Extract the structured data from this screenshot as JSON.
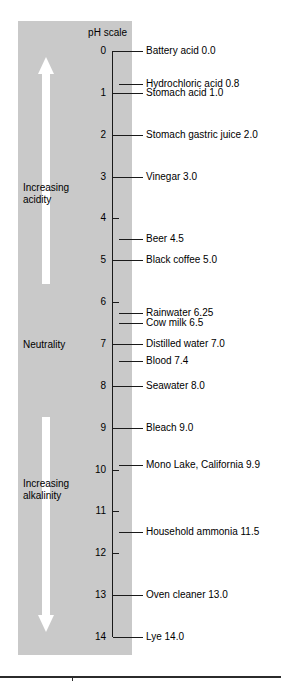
{
  "figure": {
    "title": "pH scale",
    "axis": {
      "min": 0,
      "max": 14,
      "ticks": [
        "0",
        "1",
        "2",
        "3",
        "4",
        "5",
        "6",
        "7",
        "8",
        "9",
        "10",
        "11",
        "12",
        "13",
        "14"
      ]
    },
    "annotations": {
      "increasing_acidity": "Increasing\nacidity",
      "increasing_acidity_line1": "Increasing",
      "increasing_acidity_line2": "acidity",
      "neutrality": "Neutrality",
      "increasing_alkalinity_line1": "Increasing",
      "increasing_alkalinity_line2": "alkalinity"
    },
    "colors": {
      "panel": "#c9c9c9",
      "arrow": "#ffffff",
      "axis": "#1a1a1a",
      "text": "#000000",
      "background": "#ffffff",
      "footer_rule": "#2b2b2b"
    }
  },
  "chart_data": {
    "type": "scatter",
    "title": "pH scale",
    "xlabel": "",
    "ylabel": "pH scale",
    "ylim": [
      0,
      14
    ],
    "y_inverted": true,
    "grid": false,
    "legend": "none",
    "tick_labels": [
      "0",
      "1",
      "2",
      "3",
      "4",
      "5",
      "6",
      "7",
      "8",
      "9",
      "10",
      "11",
      "12",
      "13",
      "14"
    ],
    "categories": [
      "Battery acid",
      "Hydrochloric acid",
      "Stomach acid",
      "Stomach gastric juice",
      "Vinegar",
      "Beer",
      "Black coffee",
      "Rainwater",
      "Cow milk",
      "Distilled water",
      "Blood",
      "Seawater",
      "Bleach",
      "Mono Lake, California",
      "Household ammonia",
      "Oven cleaner",
      "Lye"
    ],
    "values": [
      0.0,
      0.8,
      1.0,
      2.0,
      3.0,
      4.5,
      5.0,
      6.25,
      6.5,
      7.0,
      7.4,
      8.0,
      9.0,
      9.9,
      11.5,
      13.0,
      14.0
    ],
    "points": [
      {
        "label": "Battery acid 0.0",
        "name": "Battery acid",
        "ph": 0.0
      },
      {
        "label": "Hydrochloric acid 0.8",
        "name": "Hydrochloric acid",
        "ph": 0.8
      },
      {
        "label": "Stomach acid 1.0",
        "name": "Stomach acid",
        "ph": 1.0
      },
      {
        "label": "Stomach gastric juice 2.0",
        "name": "Stomach gastric juice",
        "ph": 2.0
      },
      {
        "label": "Vinegar 3.0",
        "name": "Vinegar",
        "ph": 3.0
      },
      {
        "label": "Beer 4.5",
        "name": "Beer",
        "ph": 4.5
      },
      {
        "label": "Black coffee 5.0",
        "name": "Black coffee",
        "ph": 5.0
      },
      {
        "label": "Rainwater 6.25",
        "name": "Rainwater",
        "ph": 6.25
      },
      {
        "label": "Cow milk 6.5",
        "name": "Cow milk",
        "ph": 6.5
      },
      {
        "label": "Distilled water 7.0",
        "name": "Distilled water",
        "ph": 7.0
      },
      {
        "label": "Blood 7.4",
        "name": "Blood",
        "ph": 7.4
      },
      {
        "label": "Seawater 8.0",
        "name": "Seawater",
        "ph": 8.0
      },
      {
        "label": "Bleach 9.0",
        "name": "Bleach",
        "ph": 9.0
      },
      {
        "label": "Mono Lake, California 9.9",
        "name": "Mono Lake, California",
        "ph": 9.9
      },
      {
        "label": "Household ammonia 11.5",
        "name": "Household ammonia",
        "ph": 11.5
      },
      {
        "label": "Oven cleaner 13.0",
        "name": "Oven cleaner",
        "ph": 13.0
      },
      {
        "label": "Lye 14.0",
        "name": "Lye",
        "ph": 14.0
      }
    ],
    "annotations": [
      {
        "text": "Increasing acidity",
        "ph_range": [
          0.5,
          5.5
        ],
        "direction": "up"
      },
      {
        "text": "Neutrality",
        "ph_range": [
          7,
          7
        ],
        "direction": "none"
      },
      {
        "text": "Increasing alkalinity",
        "ph_range": [
          8.5,
          14
        ],
        "direction": "down"
      }
    ]
  }
}
